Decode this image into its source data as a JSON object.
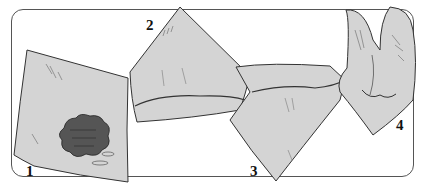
{
  "figure": {
    "colors": {
      "cloth_fill": "#d4d4d4",
      "outline": "#333333",
      "stain_fill": "#555555",
      "frame": "#555555",
      "background": "#ffffff"
    },
    "steps": [
      {
        "number": "1",
        "content": "flat square cloth with dark stain"
      },
      {
        "number": "2",
        "content": "cloth folded into triangle"
      },
      {
        "number": "3",
        "content": "cloth rolled into band with point down"
      },
      {
        "number": "4",
        "content": "cloth tied into knotted bundle"
      }
    ]
  }
}
